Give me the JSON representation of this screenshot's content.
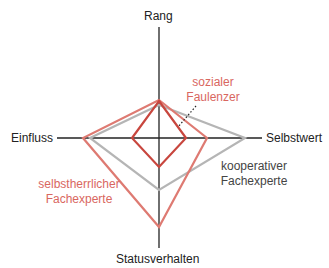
{
  "axes": {
    "top": "Rang",
    "right": "Selbstwert",
    "bottom": "Statusverhalten",
    "left": "Einfluss"
  },
  "profiles": [
    {
      "name_line1": "selbstherrlicher",
      "name_line2": "Fachexperte",
      "color": "#d9675f",
      "values": {
        "Rang": 0.34,
        "Selbstwert": 0.47,
        "Statusverhalten": 0.81,
        "Einfluss": 0.85
      }
    },
    {
      "name_line1": "kooperativer",
      "name_line2": "Fachexperte",
      "color": "#b5b5b5",
      "values": {
        "Rang": 0.3,
        "Selbstwert": 0.84,
        "Statusverhalten": 0.47,
        "Einfluss": 0.78
      }
    },
    {
      "name_line1": "sozialer",
      "name_line2": "Faulenzer",
      "color": "#c8463e",
      "values": {
        "Rang": 0.33,
        "Selbstwert": 0.26,
        "Statusverhalten": 0.26,
        "Einfluss": 0.3
      }
    }
  ],
  "colors": {
    "axis": "#222222",
    "red_label": "#d9675f",
    "gray_label": "#444444"
  }
}
